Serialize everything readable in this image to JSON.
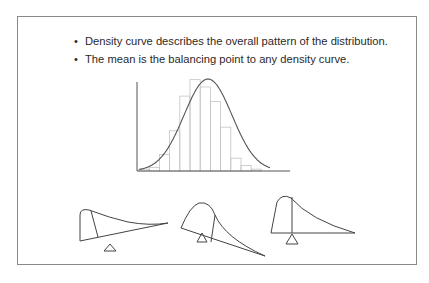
{
  "slide": {
    "bullets": [
      {
        "marker": "•",
        "text": "Density curve describes the overall pattern of the distribution."
      },
      {
        "marker": "•",
        "text": "The mean is the balancing point to any density curve."
      }
    ]
  },
  "chart_data": [
    {
      "type": "bar",
      "title": "Histogram with overlaid normal density curve",
      "xlabel": "",
      "ylabel": "",
      "grid": false,
      "legend": false,
      "categories": [
        "1",
        "2",
        "3",
        "4",
        "5",
        "6",
        "7",
        "8",
        "9",
        "10",
        "11",
        "12"
      ],
      "values": [
        1,
        2,
        9,
        22,
        41,
        50,
        46,
        38,
        24,
        7,
        3,
        1
      ],
      "overlay": {
        "type": "line",
        "shape": "normal bell curve",
        "peak_at_bar": 6
      },
      "ylim": [
        0,
        52
      ]
    },
    {
      "type": "diagram",
      "title": "Right-skewed density on a fulcrum (tilted: mean to the right)",
      "annotation": "vertical line marks median; fulcrum at mean"
    },
    {
      "type": "diagram",
      "title": "Right-skewed density on a fulcrum (tilted the other way)",
      "annotation": "fulcrum left of median line"
    },
    {
      "type": "diagram",
      "title": "Right-skewed density balanced on a fulcrum",
      "annotation": "fulcrum under the mean, baseline level"
    }
  ]
}
